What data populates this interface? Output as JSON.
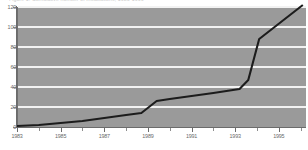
{
  "figure": {
    "caption": "Figure 1. Cumulative number of installations, 1983-1996",
    "background_color": "#ffffff"
  },
  "chart_data": {
    "type": "line",
    "title": "",
    "xlabel": "",
    "ylabel": "",
    "xlim": [
      1983,
      1996.2
    ],
    "ylim": [
      0,
      120
    ],
    "grid": true,
    "legend": "none",
    "plot_background_color": "#9a9a9a",
    "gridline_color": "#f2f2f2",
    "line_color": "#1c1c1c",
    "x_tick_labels": [
      "1983",
      "1985",
      "1987",
      "1989",
      "1991",
      "1993",
      "1995"
    ],
    "x_tick_values": [
      1983,
      1985,
      1987,
      1989,
      1991,
      1993,
      1995
    ],
    "x_minor_tick_values": [
      1984,
      1986,
      1988,
      1990,
      1992,
      1994,
      1996
    ],
    "y_tick_labels": [
      "0",
      "20",
      "40",
      "60",
      "80",
      "100",
      "120"
    ],
    "y_tick_values": [
      0,
      20,
      40,
      60,
      80,
      100,
      120
    ],
    "series": [
      {
        "name": "cumulative total",
        "x": [
          1983,
          1984,
          1985,
          1986,
          1987,
          1988,
          1988.7,
          1989.4,
          1990,
          1991,
          1992,
          1993.2,
          1993.6,
          1994.1,
          1996.1
        ],
        "values": [
          1,
          2,
          4,
          6,
          9,
          12,
          14,
          26,
          28,
          31,
          34,
          38,
          47,
          88,
          122
        ]
      }
    ]
  }
}
